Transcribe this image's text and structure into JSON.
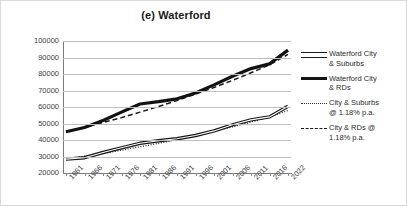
{
  "chart_data": {
    "type": "line",
    "title": "(e) Waterford",
    "xlabel": "",
    "ylabel": "",
    "ylim": [
      20000,
      100000
    ],
    "ytick_step": 10000,
    "grid": true,
    "legend_position": "right",
    "categories": [
      "1961",
      "1966",
      "1971",
      "1976",
      "1981",
      "1986",
      "1991",
      "1996",
      "2001",
      "2006",
      "2011",
      "2016",
      "2022"
    ],
    "ytick_labels": [
      "100000",
      "90000",
      "80000",
      "70000",
      "60000",
      "50000",
      "40000",
      "30000",
      "20000"
    ],
    "series": [
      {
        "name": "Waterford City & Suburbs",
        "style": "hollow-double-line",
        "values": [
          28400,
          29300,
          32400,
          35300,
          38000,
          39500,
          40800,
          42700,
          45500,
          49200,
          52200,
          54000,
          60500
        ]
      },
      {
        "name": "Waterford City & RDs",
        "style": "thick-solid",
        "values": [
          45000,
          47600,
          51800,
          56900,
          61800,
          63200,
          65000,
          68500,
          73400,
          78600,
          83300,
          86100,
          94500
        ]
      },
      {
        "name": "City & Suburbs @ 1.18% p.a.",
        "style": "dotted",
        "values": [
          28400,
          30100,
          31900,
          33800,
          35900,
          38000,
          40300,
          42700,
          45300,
          48000,
          50900,
          53900,
          57900
        ]
      },
      {
        "name": "City & RDs @ 1.18% p.a.",
        "style": "dashed",
        "values": [
          45000,
          47700,
          50600,
          53600,
          56900,
          60300,
          63900,
          67800,
          71800,
          76100,
          80700,
          85600,
          91900
        ]
      }
    ]
  },
  "legend": {
    "items": [
      {
        "label_line1": "Waterford City",
        "label_line2": "& Suburbs",
        "style": "hollow-double-line"
      },
      {
        "label_line1": "Waterford City",
        "label_line2": "& RDs",
        "style": "thick-solid"
      },
      {
        "label_line1": "City & Suburbs",
        "label_line2": "@ 1.18% p.a.",
        "style": "dotted"
      },
      {
        "label_line1": "City & RDs @",
        "label_line2": "1.18% p.a.",
        "style": "dashed"
      }
    ]
  }
}
